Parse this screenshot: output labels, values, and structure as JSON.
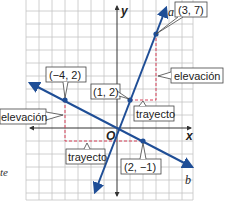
{
  "diagram": {
    "type": "coordinate-plane",
    "axes": {
      "x_label": "x",
      "y_label": "y",
      "origin_label": "O"
    },
    "grid": {
      "x_range": [
        -7,
        6
      ],
      "y_range": [
        -6,
        9
      ],
      "cell_px": 13
    },
    "colors": {
      "line": "#1f4e96",
      "dashed": "#d9435a",
      "grid": "#c4c4c4",
      "axis": "#333333"
    },
    "lines": [
      {
        "name": "a",
        "label": "a",
        "points": [
          [
            1,
            2
          ],
          [
            3,
            7
          ]
        ],
        "passes_origin_approx": true
      },
      {
        "name": "b",
        "label": "b",
        "points": [
          [
            -4,
            2
          ],
          [
            2,
            -1
          ]
        ]
      }
    ],
    "points": [
      {
        "label": "(3, 7)",
        "x": 3,
        "y": 7
      },
      {
        "label": "(1, 2)",
        "x": 1,
        "y": 2
      },
      {
        "label": "(−4, 2)",
        "x": -4,
        "y": 2
      },
      {
        "label": "(2, −1)",
        "x": 2,
        "y": -1
      }
    ],
    "callouts": {
      "rise_right": "elevación",
      "run_right": "trayecto",
      "rise_left": "elevación",
      "run_left": "trayecto"
    }
  },
  "side_text": "te"
}
